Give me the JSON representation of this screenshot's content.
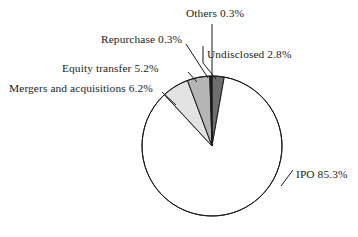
{
  "chart_data": {
    "type": "pie",
    "title": "",
    "subtitle": "",
    "xlabel": "",
    "ylabel": "",
    "legend_position": "none",
    "grid": false,
    "labels_inline": true,
    "unit": "%",
    "categories": [
      "Undisclosed",
      "IPO",
      "Mergers and acquisitions",
      "Equity transfer",
      "Repurchase",
      "Others"
    ],
    "values": [
      2.8,
      85.3,
      6.2,
      5.2,
      0.3,
      0.3
    ],
    "slices": [
      {
        "name": "Undisclosed",
        "value": 2.8,
        "label": "Undisclosed 2.8%",
        "color": "#6e6e6e",
        "start_angle": 0,
        "end_angle": 10.08
      },
      {
        "name": "IPO",
        "value": 85.3,
        "label": "IPO 85.3%",
        "color": "#ffffff",
        "start_angle": 10.08,
        "end_angle": 317.16
      },
      {
        "name": "Mergers and acquisitions",
        "value": 6.2,
        "label": "Mergers and acquisitions 6.2%",
        "color": "#e3e3e3",
        "start_angle": 317.16,
        "end_angle": 339.48
      },
      {
        "name": "Equity transfer",
        "value": 5.2,
        "label": "Equity transfer 5.2%",
        "color": "#b5b5b5",
        "start_angle": 339.48,
        "end_angle": 358.2
      },
      {
        "name": "Repurchase",
        "value": 0.3,
        "label": "Repurchase 0.3%",
        "color": "#1a1a1a",
        "start_angle": 358.2,
        "end_angle": 359.28
      },
      {
        "name": "Others",
        "value": 0.3,
        "label": "Others 0.3%",
        "color": "#1a1a1a",
        "start_angle": 359.28,
        "end_angle": 360
      }
    ],
    "geometry": {
      "center_x": 212,
      "center_y": 146,
      "radius": 70
    },
    "stroke_color": "#1a1a1a",
    "background": "#ffffff"
  },
  "labels": {
    "others": "Others 0.3%",
    "repurchase": "Repurchase 0.3%",
    "undisclosed": "Undisclosed 2.8%",
    "equity_transfer": "Equity transfer 5.2%",
    "mergers": "Mergers and acquisitions 6.2%",
    "ipo": "IPO 85.3%"
  }
}
